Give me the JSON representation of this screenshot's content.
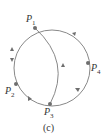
{
  "diagram": {
    "type": "circuit-graph",
    "nodes": [
      {
        "id": "P1",
        "label": "P",
        "sub": "1",
        "x": 35,
        "y": 28
      },
      {
        "id": "P2",
        "label": "P",
        "sub": "2",
        "x": 16,
        "y": 84
      },
      {
        "id": "P3",
        "label": "P",
        "sub": "3",
        "x": 50,
        "y": 104
      },
      {
        "id": "P4",
        "label": "P",
        "sub": "4",
        "x": 88,
        "y": 63
      }
    ],
    "edges": [
      {
        "from": "P1",
        "to": "P2",
        "arrows": "both",
        "path": "left arc"
      },
      {
        "from": "P2",
        "to": "P3",
        "arrows": "forward",
        "path": "lower-left arc"
      },
      {
        "from": "P3",
        "to": "P4",
        "arrows": "forward",
        "path": "lower-right arc"
      },
      {
        "from": "P4",
        "to": "P1",
        "arrows": "forward",
        "path": "upper-right arc"
      },
      {
        "from": "P3",
        "to": "P1",
        "arrows": "forward",
        "path": "inner chord arc"
      }
    ],
    "caption": "(c)",
    "colors": {
      "line": "#7a7a7a",
      "node": "#6e6e6e",
      "text": "#333333"
    }
  }
}
